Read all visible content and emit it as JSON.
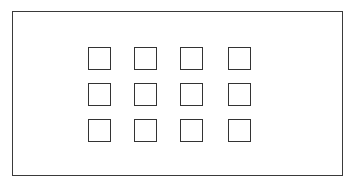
{
  "figure": {
    "kind": "grid-of-squares-diagram",
    "canvas": {
      "width": 355,
      "height": 184,
      "background": "#ffffff"
    },
    "outer_frame": {
      "name": "outer-rectangle",
      "x": 12,
      "y": 11,
      "width": 331,
      "height": 165,
      "stroke_color": "#3a3a3a",
      "stroke_width": 1.5,
      "fill": "#ffffff",
      "label": ""
    },
    "grid": {
      "name": "square-grid",
      "rows": 3,
      "columns": 4,
      "count": 12,
      "origin_x": 88,
      "origin_y": 47,
      "column_step": 46,
      "row_step": 36,
      "cell": {
        "width": 23,
        "height": 23,
        "stroke_color": "#333333",
        "stroke_width": 1.6,
        "fill": "#ffffff"
      },
      "cells": [
        {
          "id": "r1c1",
          "row": 1,
          "col": 1,
          "x": 0,
          "y": 0,
          "label": ""
        },
        {
          "id": "r1c2",
          "row": 1,
          "col": 2,
          "x": 46,
          "y": 0,
          "label": ""
        },
        {
          "id": "r1c3",
          "row": 1,
          "col": 3,
          "x": 92,
          "y": 0,
          "label": ""
        },
        {
          "id": "r1c4",
          "row": 1,
          "col": 4,
          "x": 140,
          "y": 0,
          "label": ""
        },
        {
          "id": "r2c1",
          "row": 2,
          "col": 1,
          "x": 0,
          "y": 36,
          "label": ""
        },
        {
          "id": "r2c2",
          "row": 2,
          "col": 2,
          "x": 46,
          "y": 36,
          "label": ""
        },
        {
          "id": "r2c3",
          "row": 2,
          "col": 3,
          "x": 92,
          "y": 36,
          "label": ""
        },
        {
          "id": "r2c4",
          "row": 2,
          "col": 4,
          "x": 140,
          "y": 36,
          "label": ""
        },
        {
          "id": "r3c1",
          "row": 3,
          "col": 1,
          "x": 0,
          "y": 72,
          "label": ""
        },
        {
          "id": "r3c2",
          "row": 3,
          "col": 2,
          "x": 46,
          "y": 72,
          "label": ""
        },
        {
          "id": "r3c3",
          "row": 3,
          "col": 3,
          "x": 92,
          "y": 72,
          "label": ""
        },
        {
          "id": "r3c4",
          "row": 3,
          "col": 4,
          "x": 140,
          "y": 72,
          "label": ""
        }
      ]
    }
  }
}
